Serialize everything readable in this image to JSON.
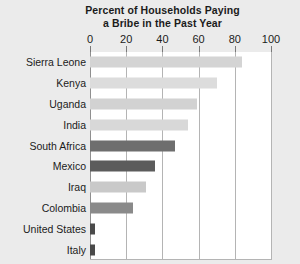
{
  "chart_data": {
    "type": "bar",
    "orientation": "horizontal",
    "title": "Percent of Households Paying a Bribe in the Past Year",
    "title_lines": [
      "Percent of Households Paying",
      "a Bribe in the Past Year"
    ],
    "xlabel": "",
    "ylabel": "",
    "xlim": [
      0,
      100
    ],
    "xticks": [
      0,
      20,
      40,
      60,
      80,
      100
    ],
    "xticklabels": [
      "0",
      "20",
      "40",
      "60",
      "80",
      "100"
    ],
    "grid": "vertical",
    "legend": "none",
    "categories": [
      "Sierra Leone",
      "Kenya",
      "Uganda",
      "India",
      "South Africa",
      "Mexico",
      "Iraq",
      "Colombia",
      "United States",
      "Italy"
    ],
    "values": [
      84,
      70,
      59,
      54,
      47,
      36,
      31,
      24,
      3,
      3
    ],
    "bar_colors": [
      "#d4d4d4",
      "#dcdcdc",
      "#d2d2d2",
      "#d8d8d8",
      "#6e6e6e",
      "#5c5c5c",
      "#c9c9c9",
      "#8a8a8a",
      "#4a4a4a",
      "#4a4a4a"
    ]
  },
  "style": {
    "figure_background": "#ebebeb",
    "plot_background": "#ffffff",
    "gridline_color": "#b4b4b4",
    "text_color": "#1b1b1b"
  }
}
